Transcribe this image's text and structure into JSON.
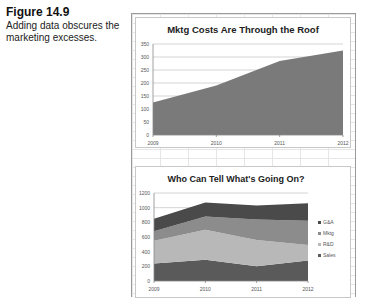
{
  "caption": {
    "figure_number": "Figure 14.9",
    "text": "Adding data obscures the marketing excesses."
  },
  "chart_data": [
    {
      "type": "area",
      "title": "Mktg Costs Are Through the Roof",
      "categories": [
        "2009",
        "2010",
        "2011",
        "2012"
      ],
      "series": [
        {
          "name": "Mktg",
          "values": [
            125,
            190,
            285,
            325
          ],
          "color": "#7a7a7a"
        }
      ],
      "xlabel": "",
      "ylabel": "",
      "ylim": [
        0,
        350
      ],
      "yticks": [
        0,
        50,
        100,
        150,
        200,
        250,
        300,
        350
      ],
      "grid": true,
      "legend": null
    },
    {
      "type": "area",
      "stacked": true,
      "title": "Who Can Tell What's Going On?",
      "categories": [
        "2009",
        "2010",
        "2011",
        "2012"
      ],
      "series": [
        {
          "name": "Sales",
          "values": [
            240,
            290,
            200,
            280
          ],
          "color": "#5a5a5a"
        },
        {
          "name": "R&D",
          "values": [
            310,
            410,
            360,
            210
          ],
          "color": "#b8b8b8"
        },
        {
          "name": "Mktg",
          "values": [
            130,
            180,
            280,
            330
          ],
          "color": "#8c8c8c"
        },
        {
          "name": "G&A",
          "values": [
            170,
            190,
            190,
            240
          ],
          "color": "#4a4a4a"
        }
      ],
      "legend_order": [
        "G&A",
        "Mktg",
        "R&D",
        "Sales"
      ],
      "xlabel": "",
      "ylabel": "",
      "ylim": [
        0,
        1200
      ],
      "yticks": [
        0,
        200,
        400,
        600,
        800,
        1000,
        1200
      ],
      "grid": true,
      "legend": "right"
    }
  ]
}
